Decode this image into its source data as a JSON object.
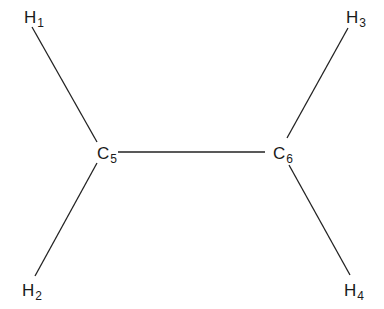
{
  "diagram": {
    "type": "structural-formula",
    "line_color": "#222222",
    "atoms": [
      {
        "id": "H1",
        "symbol": "H",
        "index": "1",
        "x": 24,
        "y": 9
      },
      {
        "id": "H2",
        "symbol": "H",
        "index": "2",
        "x": 22,
        "y": 282
      },
      {
        "id": "H3",
        "symbol": "H",
        "index": "3",
        "x": 346,
        "y": 9
      },
      {
        "id": "H4",
        "symbol": "H",
        "index": "4",
        "x": 344,
        "y": 282
      },
      {
        "id": "C5",
        "symbol": "C",
        "index": "5",
        "x": 97,
        "y": 145
      },
      {
        "id": "C6",
        "symbol": "C",
        "index": "6",
        "x": 273,
        "y": 145
      }
    ],
    "bonds": [
      {
        "from": "H1",
        "to": "C5",
        "x1": 32,
        "y1": 27,
        "x2": 97,
        "y2": 142
      },
      {
        "from": "H2",
        "to": "C5",
        "x1": 35,
        "y1": 276,
        "x2": 97,
        "y2": 163
      },
      {
        "from": "C5",
        "to": "C6",
        "x1": 118,
        "y1": 152,
        "x2": 265,
        "y2": 152
      },
      {
        "from": "H3",
        "to": "C6",
        "x1": 348,
        "y1": 28,
        "x2": 287,
        "y2": 138
      },
      {
        "from": "H4",
        "to": "C6",
        "x1": 350,
        "y1": 275,
        "x2": 289,
        "y2": 165
      }
    ]
  }
}
